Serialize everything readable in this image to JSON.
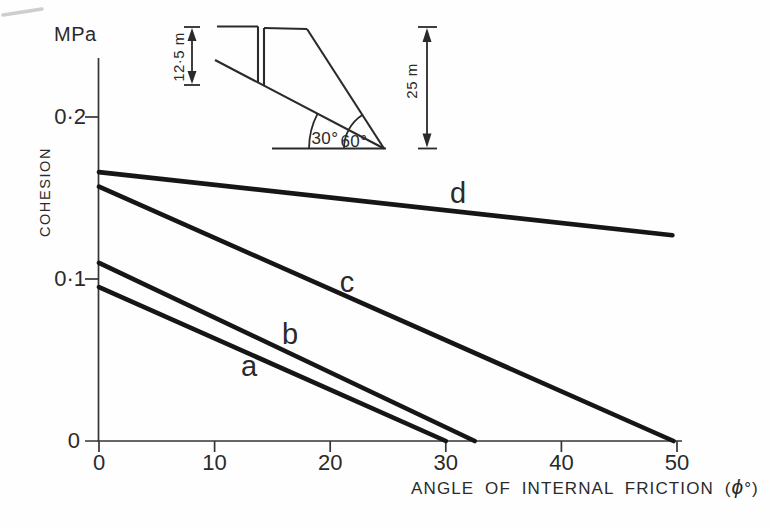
{
  "labels": {
    "mpa": "MPa",
    "cohesion": "COHESION",
    "x_title_prefix": "ANGLE OF INTERNAL FRICTION (",
    "x_title_phi": "ϕ",
    "x_title_suffix": "°)",
    "series": {
      "a": "a",
      "b": "b",
      "c": "c",
      "d": "d"
    }
  },
  "inset": {
    "crack_depth": "12·5 m",
    "slope_height": "25 m",
    "failure_plane_angle": "30°",
    "slope_face_angle": "60°"
  },
  "chart_data": {
    "type": "line",
    "title": "",
    "xlabel": "ANGLE OF INTERNAL FRICTION (ϕ°)",
    "ylabel": "COHESION",
    "y_unit": "MPa",
    "xlim": [
      0,
      50
    ],
    "ylim": [
      0,
      0.235
    ],
    "grid": false,
    "legend_position": "inline-labels-on-lines",
    "x_ticks": [
      0,
      10,
      20,
      30,
      40,
      50
    ],
    "x_tick_labels": [
      "0",
      "10",
      "20",
      "30",
      "40",
      "50"
    ],
    "y_ticks": [
      0,
      0.1,
      0.2
    ],
    "y_tick_labels": [
      "0",
      "0·1",
      "0·2"
    ],
    "series": [
      {
        "name": "a",
        "points": [
          [
            0,
            0.095
          ],
          [
            30,
            0
          ]
        ]
      },
      {
        "name": "b",
        "points": [
          [
            0,
            0.11
          ],
          [
            32.5,
            0
          ]
        ]
      },
      {
        "name": "c",
        "points": [
          [
            0,
            0.157
          ],
          [
            49.7,
            0
          ]
        ]
      },
      {
        "name": "d",
        "points": [
          [
            0,
            0.166
          ],
          [
            49.6,
            0.127
          ]
        ]
      }
    ],
    "inset_description": {
      "slope_face_angle_deg": 60,
      "failure_plane_angle_deg": 30,
      "slope_height": "25 m",
      "tension_crack_depth": "12·5 m"
    }
  }
}
